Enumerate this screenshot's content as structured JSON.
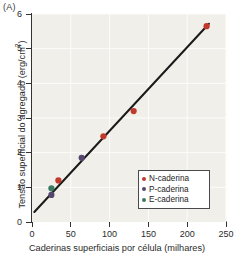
{
  "panel": {
    "label": "(A)"
  },
  "chart_data": {
    "type": "scatter",
    "title": "",
    "xlabel": "Caderinas superficiais por célula (milhares)",
    "ylabel": "Tensão superficial do agregado (erg/cm²)",
    "ylabel_main": "Tensão superficial do agregado (erg/cm",
    "ylabel_sup": "2",
    "ylabel_tail": ")",
    "xlim": [
      0,
      250
    ],
    "ylim": [
      0,
      6
    ],
    "xticks": [
      0,
      50,
      100,
      150,
      200,
      250
    ],
    "yticks": [
      0,
      1,
      2,
      3,
      4,
      5,
      6
    ],
    "grid": true,
    "grid_color": "#fdfcfa",
    "plot_background": "#f1efea",
    "legend_position": "lower right",
    "series": [
      {
        "name": "N-caderina",
        "color": "#c0392b",
        "points": [
          {
            "x": 34,
            "y": 1.2
          },
          {
            "x": 92,
            "y": 2.47
          },
          {
            "x": 131,
            "y": 3.2
          },
          {
            "x": 225,
            "y": 5.65
          }
        ]
      },
      {
        "name": "P-caderina",
        "color": "#55466e",
        "points": [
          {
            "x": 25,
            "y": 0.78
          },
          {
            "x": 64,
            "y": 1.85
          }
        ]
      },
      {
        "name": "E-caderina",
        "color": "#3a7a63",
        "points": [
          {
            "x": 25,
            "y": 0.97
          }
        ]
      }
    ],
    "fit_line": {
      "name": "linha de regressão",
      "color": "#1a1a1a",
      "x_start": 3,
      "y_start": 0.29,
      "x_end": 228,
      "y_end": 5.72
    }
  }
}
